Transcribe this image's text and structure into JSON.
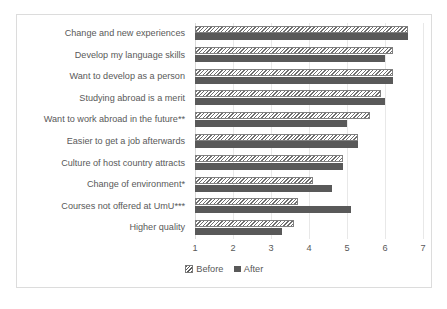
{
  "chart_data": {
    "type": "bar",
    "orientation": "horizontal",
    "title": "",
    "xlabel": "",
    "ylabel": "",
    "xlim": [
      1,
      7
    ],
    "xticks": [
      "1",
      "2",
      "3",
      "4",
      "5",
      "6",
      "7"
    ],
    "grid": true,
    "legend_position": "bottom",
    "categories": [
      "Change and new experiences",
      "Develop my language skills",
      "Want to develop as a person",
      "Studying abroad is a merit",
      "Want to work abroad in the future**",
      "Easier to get a job afterwards",
      "Culture of host country attracts",
      "Change of environment*",
      "Courses not offered at UmU***",
      "Higher quality"
    ],
    "series": [
      {
        "name": "Before",
        "values": [
          6.6,
          6.2,
          6.2,
          5.9,
          5.6,
          5.3,
          4.9,
          4.1,
          3.7,
          3.6
        ]
      },
      {
        "name": "After",
        "values": [
          6.6,
          6.0,
          6.2,
          6.0,
          5.0,
          5.3,
          4.9,
          4.6,
          5.1,
          3.3
        ]
      }
    ],
    "colors": {
      "before": "#bfbfbf",
      "after": "#595959",
      "text": "#595959",
      "grid": "#e8e8e8",
      "border": "#dcdcdc"
    }
  },
  "legend": {
    "items": [
      {
        "label": "Before",
        "swatch": "hatched-square-icon"
      },
      {
        "label": "After",
        "swatch": "solid-square-icon"
      }
    ]
  }
}
